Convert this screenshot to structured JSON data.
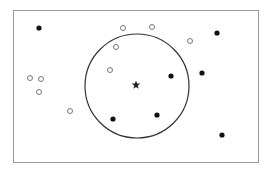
{
  "diagram": {
    "type": "knn-scatter",
    "frame": {
      "x": 13,
      "y": 10,
      "w": 246,
      "h": 153,
      "stroke": "#9a9a9a"
    },
    "circle": {
      "cx": 137,
      "cy": 86,
      "r": 52,
      "stroke": "#333333"
    },
    "query_point": {
      "x": 136,
      "y": 85,
      "symbol": "star",
      "color": "#222222"
    },
    "filled_points": [
      {
        "x": 39,
        "y": 28
      },
      {
        "x": 217,
        "y": 33
      },
      {
        "x": 171,
        "y": 76
      },
      {
        "x": 202,
        "y": 73
      },
      {
        "x": 113,
        "y": 119
      },
      {
        "x": 157,
        "y": 115
      },
      {
        "x": 222,
        "y": 135
      }
    ],
    "open_points": [
      {
        "x": 123,
        "y": 28
      },
      {
        "x": 152,
        "y": 27
      },
      {
        "x": 190,
        "y": 41
      },
      {
        "x": 116,
        "y": 47
      },
      {
        "x": 110,
        "y": 70
      },
      {
        "x": 30,
        "y": 78
      },
      {
        "x": 41,
        "y": 79
      },
      {
        "x": 39,
        "y": 92
      },
      {
        "x": 70,
        "y": 111
      }
    ],
    "colors": {
      "filled": "#111111",
      "open_stroke": "#777777"
    }
  }
}
